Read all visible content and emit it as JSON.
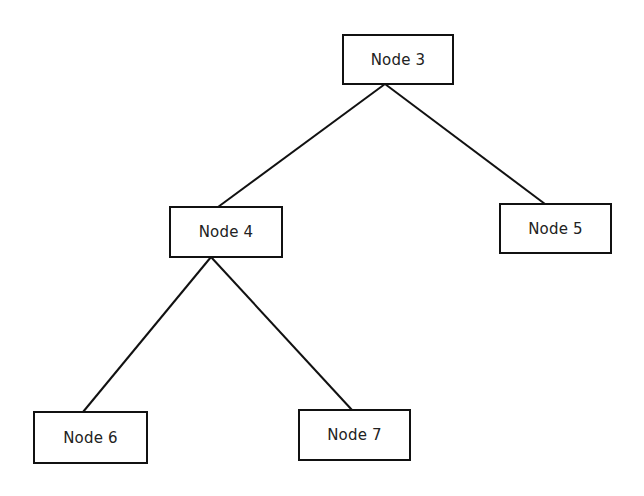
{
  "diagram": {
    "type": "tree",
    "nodes": [
      {
        "id": "n3",
        "label": "Node 3",
        "x": 342,
        "y": 34,
        "w": 112,
        "h": 51
      },
      {
        "id": "n4",
        "label": "Node 4",
        "x": 169,
        "y": 206,
        "w": 114,
        "h": 52
      },
      {
        "id": "n5",
        "label": "Node 5",
        "x": 499,
        "y": 203,
        "w": 113,
        "h": 51
      },
      {
        "id": "n6",
        "label": "Node 6",
        "x": 33,
        "y": 411,
        "w": 115,
        "h": 53
      },
      {
        "id": "n7",
        "label": "Node 7",
        "x": 298,
        "y": 409,
        "w": 113,
        "h": 52
      }
    ],
    "edges": [
      {
        "from": "Node 3",
        "to": "Node 4",
        "x1": 385,
        "y1": 84,
        "x2": 218,
        "y2": 207
      },
      {
        "from": "Node 3",
        "to": "Node 5",
        "x1": 385,
        "y1": 84,
        "x2": 545,
        "y2": 204
      },
      {
        "from": "Node 4",
        "to": "Node 6",
        "x1": 211,
        "y1": 257,
        "x2": 83,
        "y2": 412
      },
      {
        "from": "Node 4",
        "to": "Node 7",
        "x1": 211,
        "y1": 257,
        "x2": 352,
        "y2": 410
      }
    ],
    "colors": {
      "stroke": "#111111",
      "text": "#222222",
      "background": "#ffffff"
    }
  }
}
